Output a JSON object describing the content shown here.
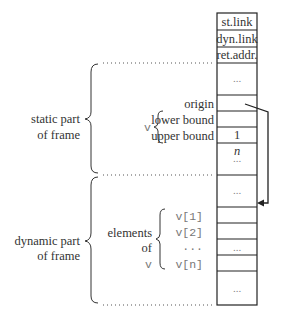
{
  "diagram": {
    "stack_cells": [
      {
        "label": "st.link"
      },
      {
        "label": "dyn.link"
      },
      {
        "label": "ret.addr."
      },
      {
        "label": "..."
      },
      {
        "label": ""
      },
      {
        "label": "1"
      },
      {
        "label": "n"
      },
      {
        "label": "..."
      },
      {
        "label": "..."
      },
      {
        "label": ""
      },
      {
        "label": ""
      },
      {
        "label": "..."
      },
      {
        "label": ""
      },
      {
        "label": "..."
      }
    ],
    "static_part": {
      "label_line1": "static part",
      "label_line2": "of frame",
      "array_name": "v",
      "fields": [
        "origin",
        "lower bound",
        "upper bound"
      ]
    },
    "dynamic_part": {
      "label_line1": "dynamic part",
      "label_line2": "of frame",
      "group_label": [
        "elements",
        "of",
        "v"
      ],
      "elements": [
        "v[1]",
        "v[2]",
        "...",
        "v[n]"
      ]
    },
    "arrow": {
      "from": "origin",
      "to": "first element of dynamic part"
    }
  }
}
